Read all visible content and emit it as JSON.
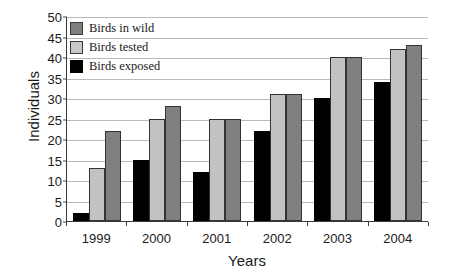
{
  "chart_data": {
    "type": "bar",
    "title": "",
    "xlabel": "Years",
    "ylabel": "Individuals",
    "categories": [
      "1999",
      "2000",
      "2001",
      "2002",
      "2003",
      "2004"
    ],
    "series": [
      {
        "name": "Birds exposed",
        "color": "#000000",
        "values": [
          2,
          15,
          12,
          22,
          30,
          34
        ]
      },
      {
        "name": "Birds tested",
        "color": "#c2c2c2",
        "values": [
          13,
          25,
          25,
          31,
          40,
          42
        ]
      },
      {
        "name": "Birds in wild",
        "color": "#808080",
        "values": [
          22,
          28,
          25,
          31,
          40,
          43
        ]
      }
    ],
    "ylim": [
      0,
      50
    ],
    "ytick_step": 5,
    "yticks": [
      "50",
      "45",
      "40",
      "35",
      "30",
      "25",
      "20",
      "15",
      "10",
      "5",
      "0"
    ],
    "grid": true,
    "legend_position": "top-left",
    "legend": [
      {
        "label": "Birds in wild",
        "swatch": "wild"
      },
      {
        "label": "Birds tested",
        "swatch": "tested"
      },
      {
        "label": "Birds exposed",
        "swatch": "exposed"
      }
    ]
  }
}
